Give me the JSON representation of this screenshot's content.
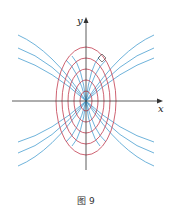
{
  "figure": {
    "caption": "图 9",
    "x_axis_label": "x",
    "y_axis_label": "y",
    "colors": {
      "ellipses": "#c23b4e",
      "curves": "#4a9fd0",
      "axes": "#333333"
    },
    "elements": {
      "ellipse_family_count": 5,
      "parabola_family_count_per_quadrant": 3,
      "right_angle_marker": true
    }
  }
}
